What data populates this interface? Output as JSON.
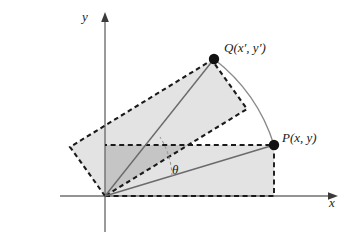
{
  "figure": {
    "axes": {
      "x_label": "x",
      "y_label": "y",
      "origin_label": "O"
    },
    "points": [
      {
        "id": "Q",
        "label": "Q(x', y')",
        "label_parts": {
          "name": "Q",
          "open": "(",
          "x": "x",
          "x_prime": "′",
          "comma": ", ",
          "y": "y",
          "y_prime": "′",
          "close": ")"
        },
        "x": 214,
        "y": 59
      },
      {
        "id": "P",
        "label": "P(x, y)",
        "label_parts": {
          "name": "P",
          "open": "(",
          "x": "x",
          "comma": ", ",
          "y": "y",
          "close": ")"
        },
        "x": 274,
        "y": 145
      }
    ],
    "angle": {
      "symbol": "θ",
      "description": "rotation angle from OP to OQ"
    },
    "shapes": {
      "axis_rectangle": "dashed rectangle from origin to P",
      "rotated_rectangle": "dashed rectangle rotated by theta",
      "arc": "circular arc from P to Q centered at origin",
      "ray_OP": "line from origin to P",
      "ray_OQ": "line from origin to Q"
    },
    "colors": {
      "stroke": "#1a1a1a",
      "line": "#5a5a5a",
      "fill_light": "#e3e3e3",
      "fill_overlap": "#c5c5c5",
      "background": "#ffffff"
    }
  }
}
